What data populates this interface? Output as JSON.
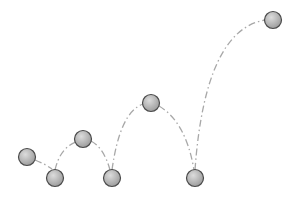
{
  "colors": {
    "background": "#ffffff",
    "ball_fill_light": "#d8d8d8",
    "ball_fill_dark": "#9a9a9a",
    "ball_stroke": "#4a4a4a",
    "path_stroke": "#a8a8a8"
  },
  "balls": [
    {
      "label": "position-1"
    },
    {
      "label": "bounce-1"
    },
    {
      "label": "apex-1"
    },
    {
      "label": "bounce-2"
    },
    {
      "label": "apex-2"
    },
    {
      "label": "bounce-3"
    },
    {
      "label": "apex-3"
    }
  ]
}
